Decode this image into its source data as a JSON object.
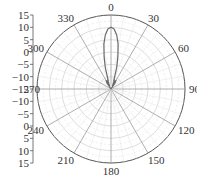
{
  "chart_data": {
    "type": "polar",
    "title": "",
    "angle_ticks": [
      "0",
      "30",
      "60",
      "90",
      "120",
      "150",
      "180",
      "210",
      "240",
      "270",
      "300",
      "330"
    ],
    "angle_direction": "clockwise",
    "zero_location": "top",
    "radial_range": [
      -15,
      15
    ],
    "radial_ticks_upper": [
      "15",
      "10",
      "5",
      "0",
      "-5",
      "-10",
      "-15"
    ],
    "radial_ticks_lower": [
      "-10",
      "-5",
      "0",
      "5",
      "10",
      "15"
    ],
    "grid": true,
    "series": [
      {
        "name": "pattern",
        "theta_deg": [
          -40,
          -34,
          -30,
          -27,
          -24,
          -22,
          -20,
          -18,
          -15,
          -12,
          -9,
          -6,
          -3,
          0,
          3,
          6,
          9,
          12,
          15,
          18,
          20,
          22,
          24,
          27,
          30,
          34,
          40
        ],
        "r_db": [
          -15,
          -12,
          -11,
          -12,
          -13.5,
          -12.5,
          -11,
          -11.5,
          -6,
          -1.5,
          3.5,
          7,
          9.3,
          10,
          9.3,
          7,
          3.5,
          -1.5,
          -6,
          -11.5,
          -11,
          -12.5,
          -13.5,
          -12,
          -11,
          -12,
          -15
        ]
      }
    ]
  }
}
